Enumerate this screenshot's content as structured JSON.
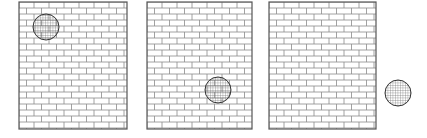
{
  "figure": {
    "width": 427,
    "height": 138,
    "background": "#ffffff",
    "stroke_color": "#555555",
    "brick_line_color": "#8a8a8a",
    "ball_hatch_color": "#666666",
    "brick": {
      "w": 15,
      "h": 6
    },
    "panels": [
      {
        "name": "panel-1",
        "x": 19,
        "y": 2,
        "w": 108,
        "h": 127,
        "ball": {
          "cx": 46,
          "cy": 27,
          "r": 13
        }
      },
      {
        "name": "panel-2",
        "x": 147,
        "y": 2,
        "w": 105,
        "h": 127,
        "ball": {
          "cx": 218,
          "cy": 90,
          "r": 13
        }
      },
      {
        "name": "panel-3",
        "x": 269,
        "y": 2,
        "w": 107,
        "h": 127,
        "ball": null
      }
    ],
    "free_ball": {
      "cx": 398,
      "cy": 93,
      "r": 13
    }
  }
}
